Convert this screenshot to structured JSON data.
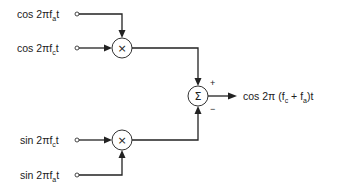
{
  "diagram": {
    "type": "signal-flow block diagram (single-sideband modulator)",
    "inputs": [
      {
        "id": "in1",
        "func": "cos",
        "prefix": "cos 2π",
        "var": "f",
        "sub": "a",
        "suffix": "t"
      },
      {
        "id": "in2",
        "func": "cos",
        "prefix": "cos 2π",
        "var": "f",
        "sub": "c",
        "suffix": "t"
      },
      {
        "id": "in3",
        "func": "sin",
        "prefix": "sin 2π",
        "var": "f",
        "sub": "c",
        "suffix": "t"
      },
      {
        "id": "in4",
        "func": "sin",
        "prefix": "sin 2π",
        "var": "f",
        "sub": "a",
        "suffix": "t"
      }
    ],
    "multipliers": [
      {
        "id": "mult1",
        "symbol": "×",
        "inputs": [
          "in1",
          "in2"
        ]
      },
      {
        "id": "mult2",
        "symbol": "×",
        "inputs": [
          "in3",
          "in4"
        ]
      }
    ],
    "summer": {
      "symbol": "Σ",
      "plus_sign": "+",
      "minus_sign": "−",
      "plus_input": "mult1",
      "minus_input": "mult2"
    },
    "output": {
      "prefix": "cos 2π (f",
      "sub1": "c",
      "mid": " + f",
      "sub2": "a",
      "suffix": ")t"
    },
    "colors": {
      "line": "#222222",
      "background": "#ffffff"
    }
  }
}
